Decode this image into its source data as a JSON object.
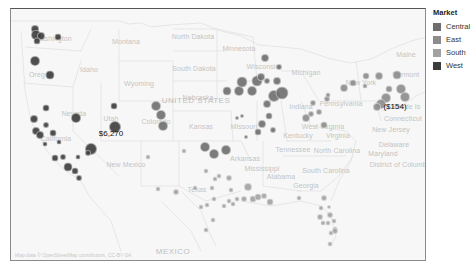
{
  "legend": {
    "title": "Market",
    "items": [
      {
        "label": "Central",
        "color": "#6e6e6e"
      },
      {
        "label": "East",
        "color": "#8c8c8c"
      },
      {
        "label": "South",
        "color": "#a2a2a2"
      },
      {
        "label": "West",
        "color": "#3c3c3c"
      }
    ]
  },
  "map": {
    "country_labels": [
      {
        "text": "UNITED STATES",
        "x": 195,
        "y": 99
      },
      {
        "text": "MEXICO",
        "x": 172,
        "y": 250
      }
    ],
    "state_labels": [
      {
        "text": "Washington",
        "x": 52,
        "y": 37
      },
      {
        "text": "Oregon",
        "x": 40,
        "y": 73
      },
      {
        "text": "Idaho",
        "x": 88,
        "y": 68
      },
      {
        "text": "Montana",
        "x": 125,
        "y": 40
      },
      {
        "text": "Wyoming",
        "x": 138,
        "y": 82
      },
      {
        "text": "Nevada",
        "x": 73,
        "y": 112
      },
      {
        "text": "California",
        "x": 55,
        "y": 137
      },
      {
        "text": "Utah",
        "x": 110,
        "y": 117
      },
      {
        "text": "Colorado",
        "x": 155,
        "y": 120
      },
      {
        "text": "North Dakota",
        "x": 192,
        "y": 35
      },
      {
        "text": "South Dakota",
        "x": 193,
        "y": 67
      },
      {
        "text": "Nebraska",
        "x": 197,
        "y": 96
      },
      {
        "text": "Kansas",
        "x": 200,
        "y": 125
      },
      {
        "text": "Minnesota",
        "x": 238,
        "y": 47
      },
      {
        "text": "Wisconsin",
        "x": 262,
        "y": 65
      },
      {
        "text": "Michigan",
        "x": 305,
        "y": 71
      },
      {
        "text": "Missouri",
        "x": 243,
        "y": 125
      },
      {
        "text": "Indiana",
        "x": 300,
        "y": 105
      },
      {
        "text": "New Mexico",
        "x": 125,
        "y": 163
      },
      {
        "text": "Arkansas",
        "x": 244,
        "y": 157
      },
      {
        "text": "Texas",
        "x": 196,
        "y": 188
      },
      {
        "text": "Tennessee",
        "x": 292,
        "y": 148
      },
      {
        "text": "Mississippi",
        "x": 261,
        "y": 167
      },
      {
        "text": "Alabama",
        "x": 280,
        "y": 175
      },
      {
        "text": "Georgia",
        "x": 305,
        "y": 184
      },
      {
        "text": "Kentucky",
        "x": 297,
        "y": 134
      },
      {
        "text": "West Virginia",
        "x": 322,
        "y": 125
      },
      {
        "text": "Virginia",
        "x": 337,
        "y": 134
      },
      {
        "text": "North Carolina",
        "x": 336,
        "y": 149
      },
      {
        "text": "South Carolina",
        "x": 325,
        "y": 169
      },
      {
        "text": "Pennsylvania",
        "x": 340,
        "y": 102
      },
      {
        "text": "New York",
        "x": 360,
        "y": 81
      },
      {
        "text": "New Jersey",
        "x": 390,
        "y": 128
      },
      {
        "text": "Delaware",
        "x": 393,
        "y": 143
      },
      {
        "text": "Maryland",
        "x": 382,
        "y": 152
      },
      {
        "text": "District of Columbia",
        "x": 400,
        "y": 163
      },
      {
        "text": "Connecticut",
        "x": 402,
        "y": 117
      },
      {
        "text": "Vermont",
        "x": 405,
        "y": 73
      },
      {
        "text": "Maine",
        "x": 405,
        "y": 53
      },
      {
        "text": "Rhode Is",
        "x": 405,
        "y": 105
      }
    ],
    "data_labels": [
      {
        "text": "$6,270",
        "x": 110,
        "y": 132
      },
      {
        "text": "($154)",
        "x": 394,
        "y": 105
      }
    ],
    "attribution": "Map data © OpenStreetMap contributors, CC-BY-SA"
  },
  "chart_data": {
    "type": "scatter",
    "title": "",
    "subtitle": "Bubble map of profit by city, colored by Market",
    "legend_position": "right",
    "legend": [
      "Central",
      "East",
      "South",
      "West"
    ],
    "annotations": [
      {
        "text": "$6,270",
        "market": "West",
        "location": "near Las Vegas/Nevada"
      },
      {
        "text": "($154)",
        "market": "East",
        "location": "near New York City"
      }
    ],
    "bubbles": [
      {
        "market": "West",
        "x": 34,
        "y": 28,
        "r": 4
      },
      {
        "market": "West",
        "x": 35,
        "y": 34,
        "r": 5
      },
      {
        "market": "West",
        "x": 40,
        "y": 35,
        "r": 4
      },
      {
        "market": "West",
        "x": 36,
        "y": 40,
        "r": 3.5
      },
      {
        "market": "West",
        "x": 57,
        "y": 36,
        "r": 3.5
      },
      {
        "market": "West",
        "x": 34,
        "y": 60,
        "r": 5
      },
      {
        "market": "West",
        "x": 49,
        "y": 74,
        "r": 4.5
      },
      {
        "market": "West",
        "x": 45,
        "y": 107,
        "r": 3.5
      },
      {
        "market": "West",
        "x": 33,
        "y": 118,
        "r": 4
      },
      {
        "market": "West",
        "x": 35,
        "y": 130,
        "r": 4
      },
      {
        "market": "West",
        "x": 39,
        "y": 134,
        "r": 4
      },
      {
        "market": "West",
        "x": 45,
        "y": 124,
        "r": 3
      },
      {
        "market": "West",
        "x": 52,
        "y": 132,
        "r": 3.5
      },
      {
        "market": "West",
        "x": 44,
        "y": 143,
        "r": 2.5
      },
      {
        "market": "West",
        "x": 58,
        "y": 141,
        "r": 2.5
      },
      {
        "market": "West",
        "x": 54,
        "y": 157,
        "r": 3.5
      },
      {
        "market": "West",
        "x": 62,
        "y": 156,
        "r": 3
      },
      {
        "market": "West",
        "x": 67,
        "y": 166,
        "r": 4.5
      },
      {
        "market": "West",
        "x": 74,
        "y": 170,
        "r": 3.5
      },
      {
        "market": "West",
        "x": 78,
        "y": 177,
        "r": 3
      },
      {
        "market": "West",
        "x": 77,
        "y": 156,
        "r": 2.5
      },
      {
        "market": "West",
        "x": 75,
        "y": 117,
        "r": 5
      },
      {
        "market": "West",
        "x": 90,
        "y": 148,
        "r": 6
      },
      {
        "market": "West",
        "x": 113,
        "y": 105,
        "r": 3.5
      },
      {
        "market": "West",
        "x": 114,
        "y": 126,
        "r": 6
      },
      {
        "market": "West",
        "x": 87,
        "y": 152,
        "r": 3
      },
      {
        "market": "South",
        "x": 147,
        "y": 156,
        "r": 2.5
      },
      {
        "market": "Central",
        "x": 155,
        "y": 105,
        "r": 5
      },
      {
        "market": "Central",
        "x": 160,
        "y": 114,
        "r": 5
      },
      {
        "market": "Central",
        "x": 162,
        "y": 125,
        "r": 5
      },
      {
        "market": "South",
        "x": 157,
        "y": 188,
        "r": 2.5
      },
      {
        "market": "South",
        "x": 175,
        "y": 191,
        "r": 3
      },
      {
        "market": "South",
        "x": 183,
        "y": 150,
        "r": 2.5
      },
      {
        "market": "Central",
        "x": 204,
        "y": 146,
        "r": 5
      },
      {
        "market": "Central",
        "x": 213,
        "y": 153,
        "r": 5
      },
      {
        "market": "Central",
        "x": 225,
        "y": 149,
        "r": 5
      },
      {
        "market": "South",
        "x": 205,
        "y": 170,
        "r": 2.5
      },
      {
        "market": "South",
        "x": 214,
        "y": 178,
        "r": 2.5
      },
      {
        "market": "South",
        "x": 218,
        "y": 175,
        "r": 2.5
      },
      {
        "market": "South",
        "x": 228,
        "y": 177,
        "r": 3
      },
      {
        "market": "South",
        "x": 194,
        "y": 187,
        "r": 2.5
      },
      {
        "market": "South",
        "x": 211,
        "y": 187,
        "r": 2.5
      },
      {
        "market": "South",
        "x": 213,
        "y": 198,
        "r": 2.5
      },
      {
        "market": "South",
        "x": 230,
        "y": 189,
        "r": 2.5
      },
      {
        "market": "South",
        "x": 200,
        "y": 206,
        "r": 2.5
      },
      {
        "market": "South",
        "x": 206,
        "y": 204,
        "r": 2.5
      },
      {
        "market": "South",
        "x": 223,
        "y": 205,
        "r": 2.5
      },
      {
        "market": "South",
        "x": 228,
        "y": 200,
        "r": 2.5
      },
      {
        "market": "South",
        "x": 232,
        "y": 203,
        "r": 2.5
      },
      {
        "market": "South",
        "x": 236,
        "y": 198,
        "r": 2.5
      },
      {
        "market": "South",
        "x": 243,
        "y": 198,
        "r": 3
      },
      {
        "market": "South",
        "x": 247,
        "y": 186,
        "r": 4
      },
      {
        "market": "South",
        "x": 252,
        "y": 198,
        "r": 3.5
      },
      {
        "market": "South",
        "x": 257,
        "y": 196,
        "r": 3.5
      },
      {
        "market": "South",
        "x": 263,
        "y": 195,
        "r": 3
      },
      {
        "market": "South",
        "x": 269,
        "y": 201,
        "r": 3.5
      },
      {
        "market": "South",
        "x": 212,
        "y": 219,
        "r": 2.5
      },
      {
        "market": "South",
        "x": 205,
        "y": 229,
        "r": 2.5
      },
      {
        "market": "South",
        "x": 298,
        "y": 197,
        "r": 2.5
      },
      {
        "market": "South",
        "x": 323,
        "y": 197,
        "r": 3
      },
      {
        "market": "South",
        "x": 320,
        "y": 207,
        "r": 2.5
      },
      {
        "market": "South",
        "x": 328,
        "y": 206,
        "r": 2
      },
      {
        "market": "South",
        "x": 319,
        "y": 216,
        "r": 3
      },
      {
        "market": "South",
        "x": 329,
        "y": 214,
        "r": 3
      },
      {
        "market": "South",
        "x": 322,
        "y": 222,
        "r": 2.5
      },
      {
        "market": "South",
        "x": 327,
        "y": 222,
        "r": 2.5
      },
      {
        "market": "South",
        "x": 333,
        "y": 220,
        "r": 2.5
      },
      {
        "market": "South",
        "x": 334,
        "y": 228,
        "r": 2.5
      },
      {
        "market": "South",
        "x": 330,
        "y": 232,
        "r": 2.5
      },
      {
        "market": "South",
        "x": 334,
        "y": 230,
        "r": 3
      },
      {
        "market": "South",
        "x": 329,
        "y": 243,
        "r": 2.5
      },
      {
        "market": "Central",
        "x": 264,
        "y": 57,
        "r": 4
      },
      {
        "market": "Central",
        "x": 278,
        "y": 66,
        "r": 3
      },
      {
        "market": "Central",
        "x": 226,
        "y": 90,
        "r": 4.5
      },
      {
        "market": "Central",
        "x": 238,
        "y": 90,
        "r": 5
      },
      {
        "market": "Central",
        "x": 241,
        "y": 81,
        "r": 5.5
      },
      {
        "market": "Central",
        "x": 251,
        "y": 90,
        "r": 5
      },
      {
        "market": "Central",
        "x": 256,
        "y": 80,
        "r": 5.5
      },
      {
        "market": "Central",
        "x": 260,
        "y": 76,
        "r": 4
      },
      {
        "market": "Central",
        "x": 266,
        "y": 80,
        "r": 3
      },
      {
        "market": "Central",
        "x": 276,
        "y": 80,
        "r": 4
      },
      {
        "market": "Central",
        "x": 273,
        "y": 95,
        "r": 6
      },
      {
        "market": "Central",
        "x": 281,
        "y": 92,
        "r": 6.5
      },
      {
        "market": "Central",
        "x": 266,
        "y": 103,
        "r": 4
      },
      {
        "market": "Central",
        "x": 268,
        "y": 115,
        "r": 3.5
      },
      {
        "market": "Central",
        "x": 261,
        "y": 123,
        "r": 4
      },
      {
        "market": "Central",
        "x": 272,
        "y": 129,
        "r": 3
      },
      {
        "market": "Central",
        "x": 257,
        "y": 131,
        "r": 3.5
      },
      {
        "market": "Central",
        "x": 236,
        "y": 117,
        "r": 2
      },
      {
        "market": "Central",
        "x": 241,
        "y": 115,
        "r": 2
      },
      {
        "market": "Central",
        "x": 245,
        "y": 136,
        "r": 2
      },
      {
        "market": "East",
        "x": 305,
        "y": 117,
        "r": 4
      },
      {
        "market": "East",
        "x": 310,
        "y": 113,
        "r": 3
      },
      {
        "market": "East",
        "x": 318,
        "y": 111,
        "r": 3
      },
      {
        "market": "East",
        "x": 323,
        "y": 124,
        "r": 3.5
      },
      {
        "market": "East",
        "x": 312,
        "y": 102,
        "r": 3
      },
      {
        "market": "East",
        "x": 326,
        "y": 98,
        "r": 3
      },
      {
        "market": "East",
        "x": 327,
        "y": 94,
        "r": 2.5
      },
      {
        "market": "East",
        "x": 343,
        "y": 87,
        "r": 4
      },
      {
        "market": "East",
        "x": 352,
        "y": 82,
        "r": 3.5
      },
      {
        "market": "East",
        "x": 364,
        "y": 85,
        "r": 2.5
      },
      {
        "market": "East",
        "x": 365,
        "y": 75,
        "r": 3.5
      },
      {
        "market": "East",
        "x": 378,
        "y": 75,
        "r": 4
      },
      {
        "market": "East",
        "x": 396,
        "y": 74,
        "r": 4.5
      },
      {
        "market": "East",
        "x": 400,
        "y": 88,
        "r": 5
      },
      {
        "market": "East",
        "x": 404,
        "y": 96,
        "r": 5
      },
      {
        "market": "East",
        "x": 388,
        "y": 88,
        "r": 3.5
      },
      {
        "market": "East",
        "x": 385,
        "y": 97,
        "r": 5
      },
      {
        "market": "East",
        "x": 380,
        "y": 103,
        "r": 5
      },
      {
        "market": "East",
        "x": 376,
        "y": 106,
        "r": 4
      }
    ]
  }
}
